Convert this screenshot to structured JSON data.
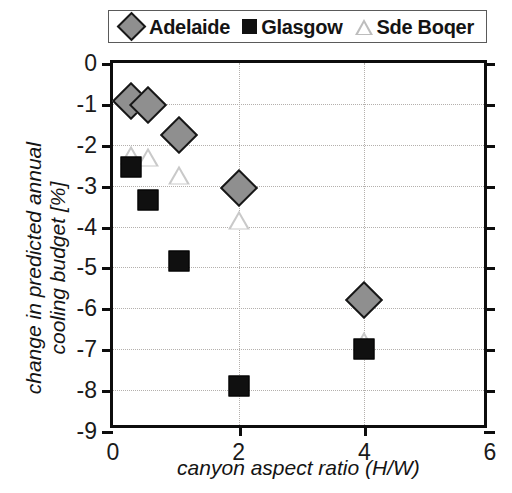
{
  "chart_data": {
    "type": "scatter",
    "title": "",
    "xlabel": "canyon aspect ratio (H/W)",
    "ylabel": "change in predicted annual cooling budget [%]",
    "xlim": [
      0,
      6
    ],
    "ylim": [
      -9,
      0
    ],
    "xticks": [
      0,
      2,
      4,
      6
    ],
    "yticks": [
      0,
      -1,
      -2,
      -3,
      -4,
      -5,
      -6,
      -7,
      -8,
      -9
    ],
    "xtick_labels": [
      "0",
      "2",
      "4",
      "6"
    ],
    "ytick_labels": [
      "0",
      "-1",
      "-2",
      "-3",
      "-4",
      "-5",
      "-6",
      "-7",
      "-8",
      "-9"
    ],
    "grid": "dotted both axes",
    "legend_position": "above plot, horizontal, boxed",
    "series": [
      {
        "name": "Adelaide",
        "marker": "diamond",
        "color": "#8f8f8f",
        "edge_color": "#171717",
        "x": [
          0.28,
          0.55,
          1.05,
          2.0,
          4.0
        ],
        "y": [
          -0.92,
          -1.02,
          -1.75,
          -3.05,
          -5.8
        ]
      },
      {
        "name": "Glasgow",
        "marker": "square",
        "color": "#101010",
        "edge_color": "#000000",
        "x": [
          0.28,
          0.55,
          1.05,
          2.0,
          4.0
        ],
        "y": [
          -2.55,
          -3.35,
          -4.85,
          -7.9,
          -7.0
        ]
      },
      {
        "name": "Sde Boqer",
        "marker": "triangle",
        "color": "#c9c9c9",
        "edge_color": "#bdbdbd",
        "x": [
          0.28,
          0.55,
          1.05,
          2.0,
          4.0
        ],
        "y": [
          -2.25,
          -2.3,
          -2.75,
          -3.85,
          -6.8
        ]
      }
    ]
  },
  "legend": {
    "entries": [
      {
        "label": "Adelaide",
        "icon": "diamond-marker-icon"
      },
      {
        "label": "Glasgow",
        "icon": "square-marker-icon"
      },
      {
        "label": "Sde Boqer",
        "icon": "triangle-marker-icon"
      }
    ]
  }
}
